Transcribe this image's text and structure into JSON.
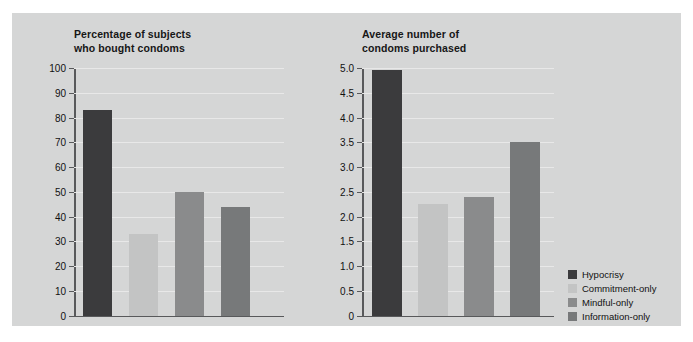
{
  "figure": {
    "background_color": "#d5d6d6",
    "page_background": "#ffffff"
  },
  "series_colors": {
    "Hypocrisy": "#3b3b3d",
    "Commitment-only": "#c3c4c4",
    "Mindful-only": "#8a8b8c",
    "Information-only": "#77797a"
  },
  "legend": {
    "position": "right",
    "items": [
      {
        "label": "Hypocrisy",
        "color": "#3b3b3d"
      },
      {
        "label": "Commitment-only",
        "color": "#c3c4c4"
      },
      {
        "label": "Mindful-only",
        "color": "#8a8b8c"
      },
      {
        "label": "Information-only",
        "color": "#77797a"
      }
    ]
  },
  "chart_data": [
    {
      "type": "bar",
      "title": "Percentage of subjects\nwho bought condoms",
      "xlabel": "",
      "ylabel": "",
      "ylim": [
        0,
        100
      ],
      "ytick_labels": [
        "100",
        "90",
        "80",
        "70",
        "60",
        "50",
        "40",
        "30",
        "20",
        "10",
        "0"
      ],
      "yticks": [
        100,
        90,
        80,
        70,
        60,
        50,
        40,
        30,
        20,
        10,
        0
      ],
      "grid": true,
      "categories": [
        "Hypocrisy",
        "Commitment-only",
        "Mindful-only",
        "Information-only"
      ],
      "values": [
        83,
        33,
        50,
        44
      ]
    },
    {
      "type": "bar",
      "title": "Average number of\ncondoms purchased",
      "xlabel": "",
      "ylabel": "",
      "ylim": [
        0,
        5.0
      ],
      "ytick_labels": [
        "5.0",
        "4.5",
        "4.0",
        "3.5",
        "3.0",
        "2.5",
        "2.0",
        "1.5",
        "1.0",
        "0.5",
        "0"
      ],
      "yticks": [
        5.0,
        4.5,
        4.0,
        3.5,
        3.0,
        2.5,
        2.0,
        1.5,
        1.0,
        0.5,
        0
      ],
      "grid": true,
      "categories": [
        "Hypocrisy",
        "Commitment-only",
        "Mindful-only",
        "Information-only"
      ],
      "values": [
        4.95,
        2.25,
        2.4,
        3.5
      ]
    }
  ]
}
